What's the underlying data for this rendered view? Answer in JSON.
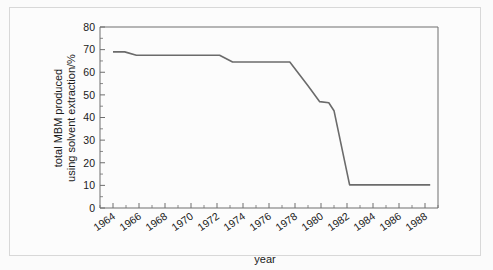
{
  "chart_data": {
    "type": "line",
    "title": "",
    "xlabel": "year",
    "ylabel": "total MBM produced using solvent extraction/%",
    "ylabel_line1": "total MBM produced",
    "ylabel_line2": "using solvent extraction/%",
    "xlim": [
      1963,
      1989
    ],
    "ylim": [
      0,
      80
    ],
    "xtick_labels": [
      "1964",
      "1966",
      "1968",
      "1970",
      "1972",
      "1974",
      "1976",
      "1978",
      "1980",
      "1982",
      "1984",
      "1986",
      "1988"
    ],
    "xtick_values": [
      1964,
      1966,
      1968,
      1970,
      1972,
      1974,
      1976,
      1978,
      1980,
      1982,
      1984,
      1986,
      1988
    ],
    "ytick_labels": [
      "0",
      "10",
      "20",
      "30",
      "40",
      "50",
      "60",
      "70",
      "80"
    ],
    "ytick_values": [
      0,
      10,
      20,
      30,
      40,
      50,
      60,
      70,
      80
    ],
    "x_minor_step": 1,
    "y_minor_step": 5,
    "grid": false,
    "legend": "none",
    "series": [
      {
        "name": "total MBM produced using solvent extraction",
        "line_color": "#6b6b6b",
        "x": [
          1964.0,
          1964.9,
          1965.8,
          1972.2,
          1973.2,
          1977.6,
          1979.0,
          1979.9,
          1980.6,
          1981.0,
          1982.2,
          1988.4
        ],
        "values": [
          69.0,
          69.0,
          67.5,
          67.5,
          64.5,
          64.5,
          54.0,
          47.0,
          46.5,
          43.0,
          10.2,
          10.2
        ]
      }
    ],
    "annotations": []
  },
  "axis": {
    "x_title": "year",
    "y_title_line1": "total MBM produced",
    "y_title_line2": "using solvent extraction/%"
  },
  "colors": {
    "line": "#6b6b6b",
    "axis": "#6e6e6e",
    "background": "#fbfbfb",
    "border": "#d8d8d8",
    "text": "#1a1a1a"
  }
}
